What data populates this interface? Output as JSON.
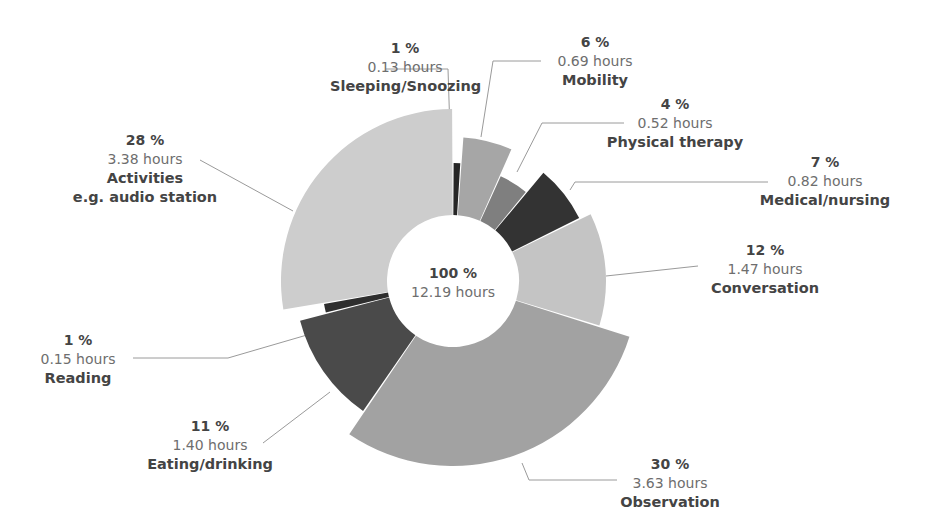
{
  "chart_data": {
    "type": "pie",
    "subtype": "variable-radius donut",
    "title": "",
    "total": {
      "percent_label": "100 %",
      "hours_label": "12.19 hours",
      "hours": 12.19
    },
    "categories": [
      "Sleeping/Snoozing",
      "Mobility",
      "Physical therapy",
      "Medical/nursing",
      "Conversation",
      "Observation",
      "Eating/drinking",
      "Reading",
      "Activities e.g. audio station"
    ],
    "values": [
      0.13,
      0.69,
      0.52,
      0.82,
      1.47,
      3.63,
      1.4,
      0.15,
      3.38
    ],
    "percents": [
      1,
      6,
      4,
      7,
      12,
      30,
      11,
      1,
      28
    ],
    "unit": "hours",
    "slices": [
      {
        "name": "Sleeping/Snoozing",
        "name_line2": "",
        "percent": "1 %",
        "hours": 0.13,
        "hours_label": "0.13 hours",
        "color": "#262626",
        "outer_r": 118
      },
      {
        "name": "Mobility",
        "name_line2": "",
        "percent": "6 %",
        "hours": 0.69,
        "hours_label": "0.69 hours",
        "color": "#a6a6a6",
        "outer_r": 144
      },
      {
        "name": "Physical therapy",
        "name_line2": "",
        "percent": "4 %",
        "hours": 0.52,
        "hours_label": "0.52 hours",
        "color": "#7f7f7f",
        "outer_r": 115
      },
      {
        "name": "Medical/nursing",
        "name_line2": "",
        "percent": "7 %",
        "hours": 0.82,
        "hours_label": "0.82 hours",
        "color": "#333333",
        "outer_r": 141
      },
      {
        "name": "Conversation",
        "name_line2": "",
        "percent": "12 %",
        "hours": 1.47,
        "hours_label": "1.47 hours",
        "color": "#c4c4c4",
        "outer_r": 153
      },
      {
        "name": "Observation",
        "name_line2": "",
        "percent": "30 %",
        "hours": 3.63,
        "hours_label": "3.63 hours",
        "color": "#a2a2a2",
        "outer_r": 185
      },
      {
        "name": "Eating/drinking",
        "name_line2": "",
        "percent": "11 %",
        "hours": 1.4,
        "hours_label": "1.40 hours",
        "color": "#4a4a4a",
        "outer_r": 158
      },
      {
        "name": "Reading",
        "name_line2": "",
        "percent": "1 %",
        "hours": 0.15,
        "hours_label": "0.15 hours",
        "color": "#2e2e2e",
        "outer_r": 131
      },
      {
        "name": "Activities",
        "name_line2": "e.g. audio station",
        "percent": "28 %",
        "hours": 3.38,
        "hours_label": "3.38 hours",
        "color": "#cdcdcd",
        "outer_r": 172
      }
    ],
    "layout": {
      "cx": 453,
      "cy": 281,
      "inner_r": 66,
      "start_angle_deg": 0,
      "direction": "clockwise",
      "gap_deg": 0.6
    }
  },
  "labels": [
    {
      "pct": "1 %",
      "hrs": "0.13 hours",
      "name": "Sleeping/Snoozing",
      "name2": "",
      "x": 330,
      "y": 39,
      "w": 150
    },
    {
      "pct": "6 %",
      "hrs": "0.69 hours",
      "name": "Mobility",
      "name2": "",
      "x": 530,
      "y": 33,
      "w": 130
    },
    {
      "pct": "4 %",
      "hrs": "0.52 hours",
      "name": "Physical therapy",
      "name2": "",
      "x": 600,
      "y": 95,
      "w": 150
    },
    {
      "pct": "7 %",
      "hrs": "0.82 hours",
      "name": "Medical/nursing",
      "name2": "",
      "x": 750,
      "y": 153,
      "w": 150
    },
    {
      "pct": "12 %",
      "hrs": "1.47 hours",
      "name": "Conversation",
      "name2": "",
      "x": 690,
      "y": 241,
      "w": 150
    },
    {
      "pct": "30 %",
      "hrs": "3.63 hours",
      "name": "Observation",
      "name2": "",
      "x": 605,
      "y": 455,
      "w": 130
    },
    {
      "pct": "11 %",
      "hrs": "1.40 hours",
      "name": "Eating/drinking",
      "name2": "",
      "x": 140,
      "y": 417,
      "w": 140
    },
    {
      "pct": "1 %",
      "hrs": "0.15 hours",
      "name": "Reading",
      "name2": "",
      "x": 28,
      "y": 331,
      "w": 100
    },
    {
      "pct": "28 %",
      "hrs": "3.38 hours",
      "name": "Activities",
      "name2": "e.g. audio station",
      "x": 70,
      "y": 131,
      "w": 150
    }
  ],
  "leaders": [
    [
      [
        386,
        69
      ],
      [
        448,
        69
      ],
      [
        451,
        163
      ]
    ],
    [
      [
        541,
        61
      ],
      [
        493,
        61
      ],
      [
        481,
        137
      ]
    ],
    [
      [
        624,
        123
      ],
      [
        542,
        123
      ],
      [
        517,
        172
      ]
    ],
    [
      [
        768,
        182
      ],
      [
        575,
        182
      ],
      [
        570,
        190
      ]
    ],
    [
      [
        698,
        266
      ],
      [
        606,
        276
      ]
    ],
    [
      [
        617,
        480
      ],
      [
        529,
        480
      ],
      [
        522,
        463
      ]
    ],
    [
      [
        263,
        443
      ],
      [
        330,
        392
      ]
    ],
    [
      [
        133,
        358
      ],
      [
        228,
        358
      ],
      [
        331,
        328
      ]
    ],
    [
      [
        200,
        160
      ],
      [
        293,
        211
      ]
    ]
  ]
}
